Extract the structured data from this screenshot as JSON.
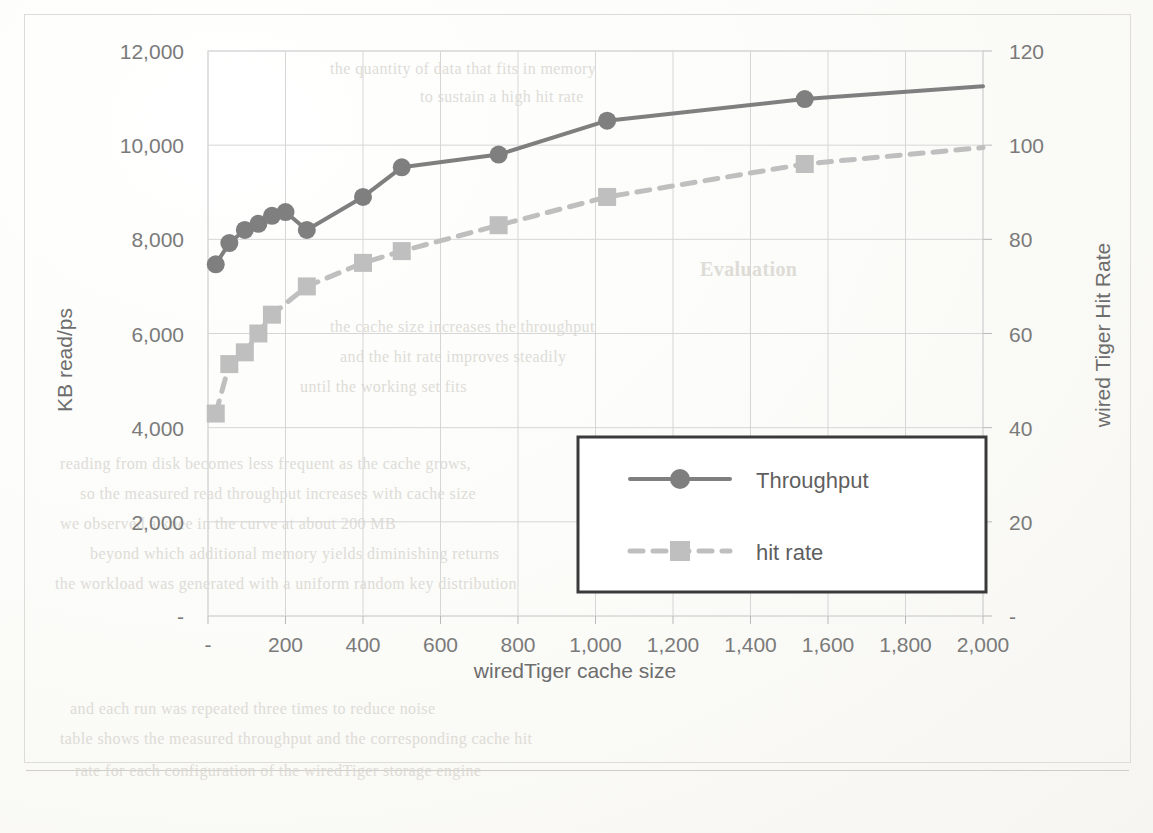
{
  "document": {
    "kind": "scanned-page-with-chart",
    "ghost_lines": [
      "the quantity of data that fits in memory",
      "to sustain a high hit rate",
      "Evaluation",
      "the cache size increases the throughput",
      "and the hit rate improves steadily",
      "until the working set fits",
      "reading from disk becomes less frequent as the cache grows,",
      "so the measured read throughput increases with cache size",
      "we observed a knee in the curve at about 200 MB",
      "beyond which additional memory yields diminishing returns",
      "the workload was generated with a uniform random key distribution",
      "and each run was repeated three times to reduce noise",
      "table shows the measured throughput and the corresponding cache hit",
      "rate for each configuration of the wiredTiger storage engine"
    ]
  },
  "chart_data": {
    "type": "line",
    "title": "",
    "xlabel": "wiredTiger cache size",
    "ylabel": "KB read/ps",
    "y2label": "wired Tiger Hit Rate",
    "xlim": [
      0,
      2000
    ],
    "ylim": [
      0,
      12000
    ],
    "y2lim": [
      0,
      120
    ],
    "xticks": [
      "-",
      "200",
      "400",
      "600",
      "800",
      "1,000",
      "1,200",
      "1,400",
      "1,600",
      "1,800",
      "2,000"
    ],
    "xtick_values": [
      0,
      200,
      400,
      600,
      800,
      1000,
      1200,
      1400,
      1600,
      1800,
      2000
    ],
    "yticks": [
      "-",
      "2,000",
      "4,000",
      "6,000",
      "8,000",
      "10,000",
      "12,000"
    ],
    "ytick_values": [
      0,
      2000,
      4000,
      6000,
      8000,
      10000,
      12000
    ],
    "y2ticks": [
      "-",
      "20",
      "40",
      "60",
      "80",
      "100",
      "120"
    ],
    "y2tick_values": [
      0,
      20,
      40,
      60,
      80,
      100,
      120
    ],
    "grid": true,
    "legend_position": "center",
    "series": [
      {
        "name": "Throughput",
        "axis": "left",
        "marker": "circle",
        "linestyle": "solid",
        "color": "#7f7f7f",
        "x": [
          20,
          55,
          95,
          130,
          165,
          200,
          255,
          400,
          500,
          750,
          1030,
          1540,
          2000
        ],
        "values": [
          7470,
          7920,
          8200,
          8330,
          8500,
          8580,
          8200,
          8900,
          9530,
          9800,
          10520,
          10980,
          11250
        ]
      },
      {
        "name": "hit rate",
        "axis": "right",
        "marker": "square",
        "linestyle": "dashed",
        "color": "#bfbfbf",
        "x": [
          20,
          55,
          95,
          130,
          165,
          255,
          400,
          500,
          750,
          1030,
          1540,
          2000
        ],
        "values": [
          43,
          53.5,
          56,
          60,
          64,
          70,
          75,
          77.5,
          83,
          89,
          96,
          99.5
        ]
      }
    ]
  },
  "legend": {
    "entries": [
      {
        "label": "Throughput",
        "marker": "circle",
        "linestyle": "solid"
      },
      {
        "label": "hit rate",
        "marker": "square",
        "linestyle": "dashed"
      }
    ]
  },
  "colors": {
    "throughput": "#7f7f7f",
    "hit_rate": "#bfbfbf",
    "grid": "#d6d6d6",
    "text": "#6f6f6f",
    "legend_border": "#3a3a3a"
  }
}
